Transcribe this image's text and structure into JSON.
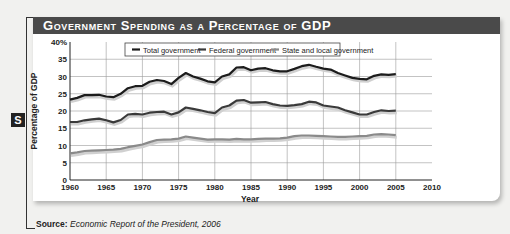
{
  "header": {
    "title": "Government Spending as a Percentage of GDP",
    "badge": "S"
  },
  "source": {
    "label": "Source:",
    "text": "Economic Report of the President, 2006"
  },
  "colors": {
    "total": "#1c1c1c",
    "federal": "#3a3a3a",
    "state_local": "#8a8a8a",
    "title_bar": "#4a4a4a"
  },
  "chart_data": {
    "type": "line",
    "title": "Government Spending as a Percentage of GDP",
    "xlabel": "Year",
    "ylabel": "Percentage of GDP",
    "xlim": [
      1960,
      2010
    ],
    "ylim": [
      0,
      40
    ],
    "x_ticks": [
      "1960",
      "1965",
      "1970",
      "1975",
      "1980",
      "1985",
      "1990",
      "1995",
      "2000",
      "2005",
      "2010"
    ],
    "y_ticks": [
      "0",
      "5",
      "10",
      "15",
      "20",
      "25",
      "30",
      "35",
      "40%"
    ],
    "grid": true,
    "legend_position": "top",
    "x": [
      1960,
      1961,
      1962,
      1963,
      1964,
      1965,
      1966,
      1967,
      1968,
      1969,
      1970,
      1971,
      1972,
      1973,
      1974,
      1975,
      1976,
      1977,
      1978,
      1979,
      1980,
      1981,
      1982,
      1983,
      1984,
      1985,
      1986,
      1987,
      1988,
      1989,
      1990,
      1991,
      1992,
      1993,
      1994,
      1995,
      1996,
      1997,
      1998,
      1999,
      2000,
      2001,
      2002,
      2003,
      2004,
      2005
    ],
    "series": [
      {
        "name": "Total government",
        "values": [
          23.3,
          23.8,
          24.6,
          24.6,
          24.7,
          24.2,
          24.0,
          25.0,
          26.6,
          27.2,
          27.3,
          28.5,
          29.0,
          28.7,
          27.8,
          29.6,
          31.0,
          30.0,
          29.4,
          28.6,
          28.3,
          30.0,
          30.6,
          32.6,
          32.7,
          31.8,
          32.3,
          32.4,
          31.8,
          31.5,
          31.5,
          32.2,
          33.0,
          33.4,
          32.8,
          32.3,
          32.0,
          31.0,
          30.3,
          29.6,
          29.3,
          29.2,
          30.2,
          30.6,
          30.5,
          30.7
        ]
      },
      {
        "name": "Federal government",
        "values": [
          16.8,
          16.8,
          17.3,
          17.6,
          17.8,
          17.3,
          16.7,
          17.4,
          19.0,
          19.2,
          19.0,
          19.5,
          19.7,
          19.8,
          19.0,
          19.6,
          21.0,
          20.6,
          20.2,
          19.7,
          19.4,
          21.0,
          21.6,
          23.0,
          23.2,
          22.4,
          22.5,
          22.6,
          22.0,
          21.6,
          21.5,
          21.7,
          22.0,
          22.7,
          22.5,
          21.6,
          21.3,
          21.0,
          20.2,
          19.6,
          19.0,
          19.0,
          19.7,
          20.2,
          20.0,
          20.1
        ]
      },
      {
        "name": "State and local government",
        "values": [
          7.7,
          8.0,
          8.4,
          8.5,
          8.6,
          8.7,
          8.8,
          9.0,
          9.5,
          9.9,
          10.3,
          11.0,
          11.6,
          11.7,
          11.8,
          12.0,
          12.6,
          12.3,
          12.0,
          11.7,
          11.8,
          11.8,
          11.7,
          11.9,
          11.8,
          11.8,
          11.9,
          12.0,
          12.0,
          12.1,
          12.3,
          12.7,
          12.9,
          12.9,
          12.8,
          12.7,
          12.6,
          12.5,
          12.5,
          12.6,
          12.7,
          12.8,
          13.2,
          13.3,
          13.2,
          13.0
        ]
      }
    ]
  }
}
